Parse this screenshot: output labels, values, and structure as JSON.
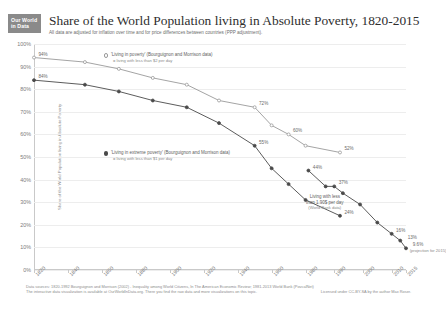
{
  "header": {
    "logo_line1": "Our World",
    "logo_line2": "in Data",
    "title": "Share of the World Population living in Absolute Poverty, 1820-2015",
    "subtitle": "All data are adjusted for inflation over time and for price differences between countries (PPP adjustment)."
  },
  "legend": {
    "series1_label": "'Living in poverty' (Bourguignon and Morrison data)",
    "series1_sub": "= living with less than $2 per day",
    "series2_label": "'Living in extreme poverty' (Bourguignon and Morrison data)",
    "series2_sub": "= living with less than $1 per day"
  },
  "annotation": {
    "line1": "Living with less",
    "line2": "than 1.90$ per day",
    "line3": "(World Bank data)"
  },
  "footer": {
    "sources": "Data sources: 1820-1992 Bourguignon and Morrison (2002) - Inequality among World Citizens, In The American Economic Review; 1981-2013 World Bank (PovcalNet)",
    "interactive": "The interactive data visualization is available at OurWorldInData.org. There you find the raw data and more visualizations on this topic.",
    "license": "Licensed under CC-BY-SA by the author Max Roser."
  },
  "chart_data": {
    "type": "line",
    "title": "Share of the World Population living in Absolute Poverty, 1820-2015",
    "subtitle": "All data are adjusted for inflation over time and for price differences between countries (PPP adjustment).",
    "xlabel": "",
    "ylabel": "Share of the World Population living in Absolute Poverty",
    "ylim": [
      0,
      100
    ],
    "xlim": [
      1820,
      2015
    ],
    "grid": true,
    "legend_position": "inside-upper-left",
    "ytick_labels": [
      "0%",
      "10%",
      "20%",
      "30%",
      "40%",
      "50%",
      "60%",
      "70%",
      "80%",
      "90%",
      "100%"
    ],
    "ytick_values": [
      0,
      10,
      20,
      30,
      40,
      50,
      60,
      70,
      80,
      90,
      100
    ],
    "xtick_labels": [
      "1820",
      "1840",
      "1860",
      "1880",
      "1900",
      "1920",
      "1940",
      "1960",
      "1980",
      "1990",
      "2000",
      "2010",
      "2015"
    ],
    "xtick_values": [
      1820,
      1840,
      1860,
      1880,
      1900,
      1920,
      1940,
      1960,
      1980,
      1990,
      2000,
      2010,
      2015
    ],
    "series": [
      {
        "name": "'Living in poverty' (Bourguignon and Morrison data) = living with less than $2 per day",
        "color": "#9a9a9a",
        "x": [
          1820,
          1850,
          1870,
          1890,
          1910,
          1929,
          1950,
          1960,
          1970,
          1980,
          1992
        ],
        "values": [
          94,
          92,
          89,
          85,
          82,
          75,
          72,
          64,
          60,
          55,
          52
        ],
        "point_labels": [
          {
            "x": 1820,
            "y": 94,
            "text": "94%"
          },
          {
            "x": 1950,
            "y": 72,
            "text": "72%"
          },
          {
            "x": 1970,
            "y": 60,
            "text": "60%"
          },
          {
            "x": 1992,
            "y": 52,
            "text": "52%"
          }
        ]
      },
      {
        "name": "'Living in extreme poverty' (Bourguignon and Morrison data) = living with less than $1 per day",
        "color": "#4a4a4a",
        "x": [
          1820,
          1850,
          1870,
          1890,
          1910,
          1929,
          1950,
          1960,
          1970,
          1980,
          1992
        ],
        "values": [
          84,
          82,
          79,
          75,
          72,
          65,
          55,
          45,
          38,
          31,
          24
        ],
        "point_labels": [
          {
            "x": 1820,
            "y": 84,
            "text": "84%"
          },
          {
            "x": 1950,
            "y": 55,
            "text": "55%"
          },
          {
            "x": 1992,
            "y": 24,
            "text": "24%"
          }
        ]
      },
      {
        "name": "Living with less than 1.90$ per day (World Bank data)",
        "color": "#4a4a4a",
        "x": [
          1981,
          1987,
          1990,
          1993,
          1999,
          2005,
          2010,
          2013,
          2015
        ],
        "values": [
          44,
          37,
          37,
          34,
          29,
          21,
          16,
          13,
          9.6
        ],
        "point_labels": [
          {
            "x": 1981,
            "y": 44,
            "text": "44%"
          },
          {
            "x": 1990,
            "y": 37,
            "text": "37%"
          },
          {
            "x": 2010,
            "y": 16,
            "text": "16%"
          },
          {
            "x": 2013,
            "y": 13,
            "text": "13%"
          },
          {
            "x": 2015,
            "y": 9.6,
            "text": "9.6%"
          }
        ],
        "end_note": "(projection for 2015)"
      }
    ]
  }
}
